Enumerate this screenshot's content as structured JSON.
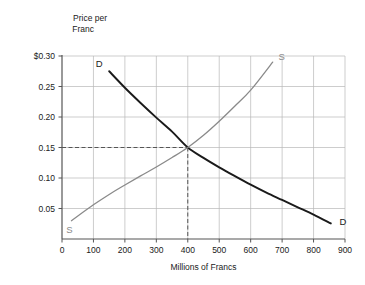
{
  "chart_data": {
    "type": "line",
    "title": "",
    "xlabel": "Millions of Francs",
    "ylabel_line1": "Price per",
    "ylabel_line2": "Franc",
    "xlim": [
      0,
      900
    ],
    "ylim": [
      0,
      0.3
    ],
    "grid": true,
    "legend_position": "inline-endpoint-labels",
    "x_ticks": [
      0,
      100,
      200,
      300,
      400,
      500,
      600,
      700,
      800,
      900
    ],
    "x_tick_labels": [
      "0",
      "100",
      "200",
      "300",
      "400",
      "500",
      "600",
      "700",
      "800",
      "900"
    ],
    "y_ticks": [
      0.05,
      0.1,
      0.15,
      0.2,
      0.25,
      0.3
    ],
    "y_tick_labels": [
      "0.05",
      "0.10",
      "0.15",
      "0.20",
      "0.25",
      "$0.30"
    ],
    "series": [
      {
        "name": "D",
        "label": "Demand",
        "color": "#1a1a1a",
        "label_start": "D",
        "label_end": "D",
        "points": [
          [
            150,
            0.275
          ],
          [
            200,
            0.248
          ],
          [
            250,
            0.223
          ],
          [
            300,
            0.199
          ],
          [
            350,
            0.176
          ],
          [
            400,
            0.15
          ],
          [
            450,
            0.133
          ],
          [
            500,
            0.1175
          ],
          [
            550,
            0.103
          ],
          [
            600,
            0.089
          ],
          [
            650,
            0.076
          ],
          [
            700,
            0.064
          ],
          [
            750,
            0.052
          ],
          [
            800,
            0.04
          ],
          [
            855,
            0.0255
          ]
        ]
      },
      {
        "name": "S",
        "label": "Supply",
        "color": "#8a8a8a",
        "label_start": "S",
        "label_end": "S",
        "points": [
          [
            30,
            0.03
          ],
          [
            100,
            0.056
          ],
          [
            150,
            0.073
          ],
          [
            200,
            0.0885
          ],
          [
            250,
            0.1035
          ],
          [
            300,
            0.118
          ],
          [
            350,
            0.1335
          ],
          [
            400,
            0.15
          ],
          [
            450,
            0.17
          ],
          [
            500,
            0.193
          ],
          [
            550,
            0.218
          ],
          [
            600,
            0.244
          ],
          [
            670,
            0.29
          ]
        ]
      }
    ],
    "equilibrium": {
      "x": 400,
      "y": 0.15,
      "guide_style": "dashed",
      "guide_color": "#555555"
    },
    "colors": {
      "demand": "#1a1a1a",
      "supply": "#8a8a8a",
      "grid": "#b8b8b8",
      "axis": "#555555",
      "background": "#ffffff"
    }
  }
}
